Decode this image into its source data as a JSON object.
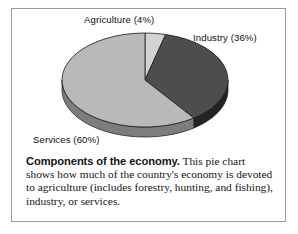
{
  "figure": {
    "frame_border_color": "#9a9a9a",
    "background": "#ffffff"
  },
  "labels": {
    "agriculture": "Agriculture (4%)",
    "industry": "Industry (36%)",
    "services": "Services (60%)"
  },
  "caption": {
    "lead": "Components of the economy.",
    "body": " This pie chart shows how much of the country's economy is devoted to agriculture (includes forestry, hunting, and fishing), industry, or services."
  },
  "chart_data": {
    "type": "pie",
    "title": "Components of the economy",
    "labels": [
      "Agriculture",
      "Industry",
      "Services"
    ],
    "values": [
      4,
      36,
      60
    ],
    "value_unit": "%",
    "slice_labels": [
      "Agriculture (4%)",
      "Industry (36%)",
      "Services (60%)"
    ],
    "colors": [
      "#d2d2d2",
      "#4d4d4d",
      "#b9b9b9"
    ],
    "side_colors": [
      "#8e8e8e",
      "#232323",
      "#7d7d7d"
    ],
    "legend": "none",
    "legend_position": "callout-labels",
    "grid": false,
    "three_d": true,
    "start_angle_deg": -90,
    "direction": "clockwise",
    "center": [
      145,
      80
    ],
    "radius_x": 83,
    "radius_y": 47,
    "depth": 10,
    "xlabel": "",
    "ylabel": ""
  }
}
